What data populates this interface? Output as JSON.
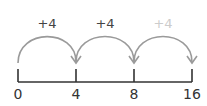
{
  "number_line": {
    "ticks": [
      {
        "value": "0",
        "x": 18
      },
      {
        "value": "4",
        "x": 76
      },
      {
        "value": "8",
        "x": 134
      },
      {
        "value": "16",
        "x": 192
      }
    ],
    "line_color": "#333333"
  },
  "jumps": [
    {
      "label": "+4",
      "from_x": 18,
      "to_x": 76,
      "label_color": "#444444"
    },
    {
      "label": "+4",
      "from_x": 76,
      "to_x": 134,
      "label_color": "#444444"
    },
    {
      "label": "+4",
      "from_x": 134,
      "to_x": 192,
      "label_color": "#cccccc"
    }
  ],
  "arc_color": "#9a9a9a"
}
